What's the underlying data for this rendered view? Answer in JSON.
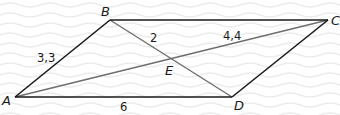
{
  "diagram": {
    "type": "parallelogram",
    "colors": {
      "background": "#ffffff",
      "wave_texture": "#ececec",
      "side_stroke": "#1a1a1a",
      "diagonal_stroke": "#6e6e6e",
      "text": "#1a1a1a"
    },
    "vertices": {
      "A": {
        "label": "A",
        "x": 15,
        "y": 97
      },
      "B": {
        "label": "B",
        "x": 110,
        "y": 20
      },
      "C": {
        "label": "C",
        "x": 328,
        "y": 20
      },
      "D": {
        "label": "D",
        "x": 232,
        "y": 97
      },
      "E": {
        "label": "E",
        "x": 172,
        "y": 58
      }
    },
    "sides": [
      {
        "from": "A",
        "to": "B"
      },
      {
        "from": "B",
        "to": "C"
      },
      {
        "from": "C",
        "to": "D"
      },
      {
        "from": "D",
        "to": "A"
      }
    ],
    "diagonals": [
      {
        "from": "A",
        "to": "C"
      },
      {
        "from": "B",
        "to": "D"
      }
    ],
    "measurements": {
      "AB": "3,3",
      "BE": "2",
      "EC": "4,4",
      "AD": "6"
    }
  }
}
